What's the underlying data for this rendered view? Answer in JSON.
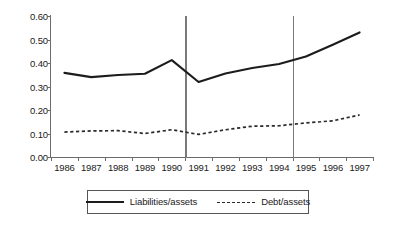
{
  "chart_data": {
    "type": "line",
    "title": "",
    "subtitle": "",
    "xlabel": "",
    "ylabel": "",
    "xlim": [
      1985.5,
      1997.5
    ],
    "ylim": [
      0.0,
      0.6
    ],
    "grid": false,
    "legend_position": "bottom-center",
    "categories": [
      "1986",
      "1987",
      "1988",
      "1989",
      "1990",
      "1991",
      "1992",
      "1993",
      "1994",
      "1995",
      "1996",
      "1997"
    ],
    "x": [
      1986,
      1987,
      1988,
      1989,
      1990,
      1991,
      1992,
      1993,
      1994,
      1995,
      1996,
      1997
    ],
    "xtick_labels": [
      "1986",
      "1987",
      "1988",
      "1989",
      "1990",
      "1991",
      "1992",
      "1993",
      "1994",
      "1995",
      "1996",
      "1997"
    ],
    "ytick_labels": [
      "0.00",
      "0.10",
      "0.20",
      "0.30",
      "0.40",
      "0.50",
      "0.60"
    ],
    "ytick_values": [
      0.0,
      0.1,
      0.2,
      0.3,
      0.4,
      0.5,
      0.6
    ],
    "series": [
      {
        "name": "Liabilities/assets",
        "style": "solid",
        "color": "#1c1c1c",
        "values": [
          0.358,
          0.34,
          0.349,
          0.354,
          0.412,
          0.319,
          0.355,
          0.379,
          0.396,
          0.428,
          0.478,
          0.53
        ]
      },
      {
        "name": "Debt/assets",
        "style": "dashed",
        "color": "#2a2a2a",
        "values": [
          0.106,
          0.111,
          0.112,
          0.1,
          0.116,
          0.096,
          0.116,
          0.131,
          0.133,
          0.145,
          0.154,
          0.179
        ]
      }
    ],
    "annotations": [
      {
        "type": "vertical-line",
        "x": 1990.5,
        "color": "#7a7a7a"
      },
      {
        "type": "vertical-line",
        "x": 1994.5,
        "color": "#7a7a7a"
      }
    ]
  },
  "legend": {
    "entries": [
      {
        "label": "Liabilities/assets"
      },
      {
        "label": "Debt/assets"
      }
    ]
  }
}
